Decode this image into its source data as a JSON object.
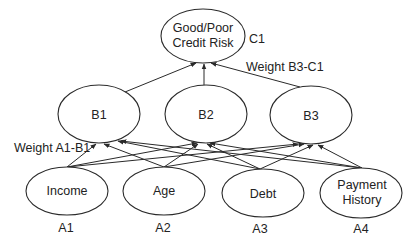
{
  "diagram": {
    "type": "neural-network",
    "output_layer": [
      {
        "id": "C1",
        "label_lines": [
          "Good/Poor",
          "Credit Risk"
        ],
        "tag": "C1"
      }
    ],
    "hidden_layer": [
      {
        "id": "B1",
        "label_lines": [
          "B1"
        ]
      },
      {
        "id": "B2",
        "label_lines": [
          "B2"
        ]
      },
      {
        "id": "B3",
        "label_lines": [
          "B3"
        ]
      }
    ],
    "input_layer": [
      {
        "id": "A1",
        "label_lines": [
          "Income"
        ],
        "tag": "A1"
      },
      {
        "id": "A2",
        "label_lines": [
          "Age"
        ],
        "tag": "A2"
      },
      {
        "id": "A3",
        "label_lines": [
          "Debt"
        ],
        "tag": "A3"
      },
      {
        "id": "A4",
        "label_lines": [
          "Payment",
          "History"
        ],
        "tag": "A4"
      }
    ],
    "edges": [
      {
        "from": "A1",
        "to": "B1"
      },
      {
        "from": "A1",
        "to": "B2"
      },
      {
        "from": "A1",
        "to": "B3"
      },
      {
        "from": "A2",
        "to": "B1"
      },
      {
        "from": "A2",
        "to": "B2"
      },
      {
        "from": "A2",
        "to": "B3"
      },
      {
        "from": "A3",
        "to": "B1"
      },
      {
        "from": "A3",
        "to": "B2"
      },
      {
        "from": "A3",
        "to": "B3"
      },
      {
        "from": "A4",
        "to": "B1"
      },
      {
        "from": "A4",
        "to": "B2"
      },
      {
        "from": "A4",
        "to": "B3"
      },
      {
        "from": "B1",
        "to": "C1"
      },
      {
        "from": "B2",
        "to": "C1"
      },
      {
        "from": "B3",
        "to": "C1"
      }
    ],
    "annotations": {
      "weight_b3_c1": "Weight B3-C1",
      "weight_a1_b1": "Weight A1-B1"
    }
  }
}
